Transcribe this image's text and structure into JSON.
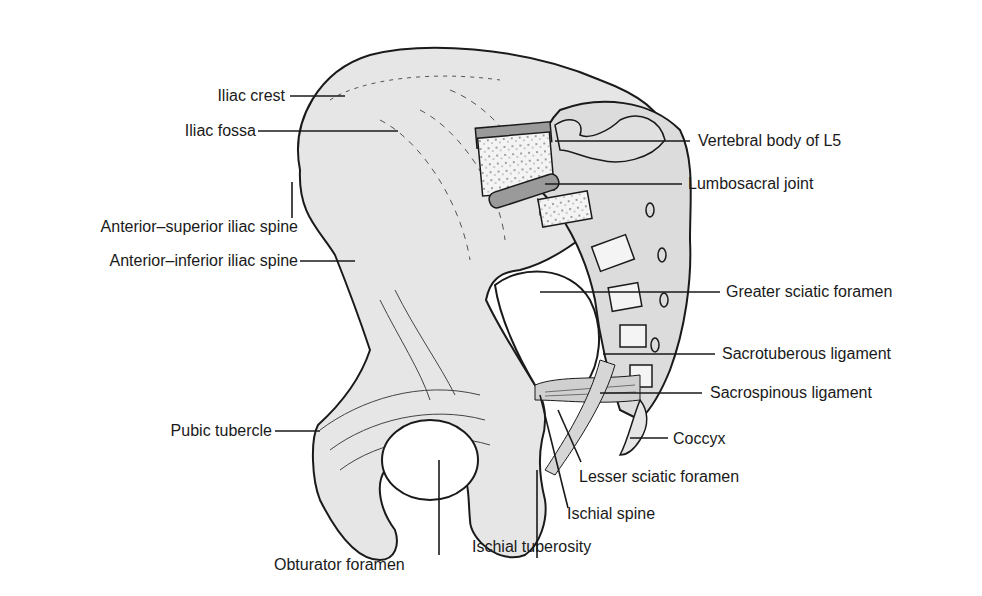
{
  "figure": {
    "colors": {
      "bone": "#e6e6e6",
      "bone_shadow": "#cfcfcf",
      "outline": "#1a1a1a",
      "cartilage": "#9a9a9a",
      "background": "#ffffff",
      "label_text": "#1a1a1a"
    },
    "labels": {
      "iliac_crest": "Iliac crest",
      "iliac_fossa": "Iliac fossa",
      "asis": "Anterior–superior iliac spine",
      "aiis": "Anterior–inferior iliac spine",
      "pubic_tubercle": "Pubic tubercle",
      "obturator_foramen": "Obturator foramen",
      "ischial_tuberosity": "Ischial tuberosity",
      "ischial_spine": "Ischial spine",
      "lesser_sciatic_foramen": "Lesser sciatic foramen",
      "coccyx": "Coccyx",
      "sacrospinous_ligament": "Sacrospinous ligament",
      "sacrotuberous_ligament": "Sacrotuberous ligament",
      "greater_sciatic_foramen": "Greater sciatic foramen",
      "lumbosacral_joint": "Lumbosacral joint",
      "vertebral_body_l5": "Vertebral body of L5"
    }
  }
}
